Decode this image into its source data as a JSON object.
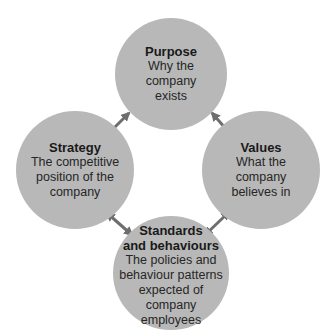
{
  "diagram": {
    "type": "cycle",
    "nodes": [
      {
        "id": "purpose",
        "title": "Purpose",
        "lines": [
          "Why the",
          "company",
          "exists"
        ]
      },
      {
        "id": "values",
        "title": "Values",
        "lines": [
          "What the",
          "company",
          "believes in"
        ]
      },
      {
        "id": "standards",
        "title_lines": [
          "Standards",
          "and behaviours"
        ],
        "lines": [
          "The policies and",
          "behaviour patterns",
          "expected of company",
          "employees"
        ]
      },
      {
        "id": "strategy",
        "title": "Strategy",
        "lines": [
          "The competitive",
          "position of the",
          "company"
        ]
      }
    ],
    "links": [
      {
        "from": "purpose",
        "to": "values",
        "style": "double-arrow"
      },
      {
        "from": "values",
        "to": "standards",
        "style": "double-arrow"
      },
      {
        "from": "standards",
        "to": "strategy",
        "style": "double-arrow"
      },
      {
        "from": "strategy",
        "to": "purpose",
        "style": "double-arrow"
      }
    ],
    "colors": {
      "node_fill": "#b8b8b8",
      "arrow": "#6e6e6e",
      "text": "#1a1a1a"
    }
  }
}
